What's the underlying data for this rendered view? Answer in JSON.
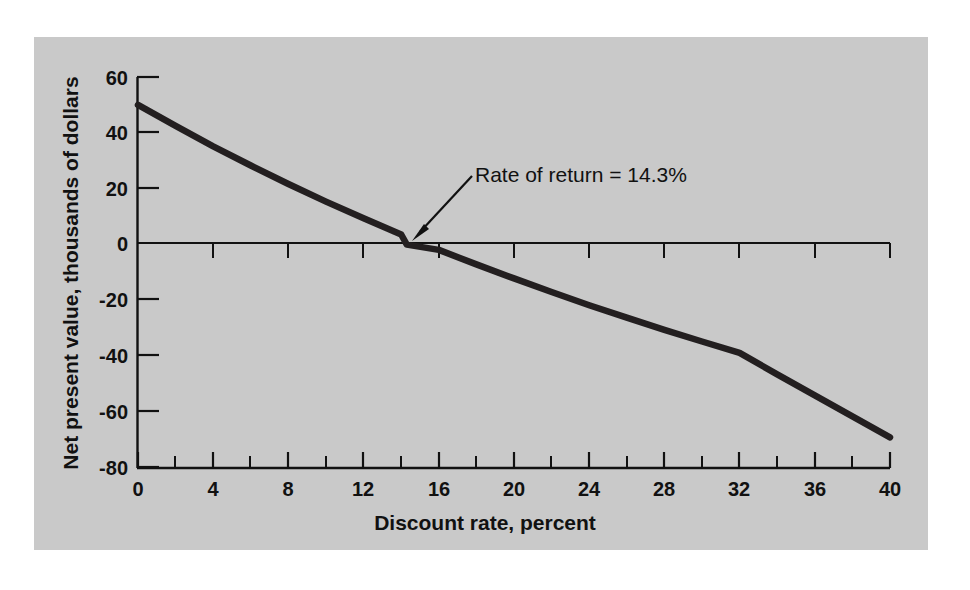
{
  "chart_data": {
    "type": "line",
    "title": "",
    "subtitle": "",
    "xlabel": "Discount rate, percent",
    "ylabel": "Net present value, thousands of dollars",
    "xlim": [
      0,
      40
    ],
    "ylim": [
      -80,
      60
    ],
    "grid": false,
    "legend": null,
    "x_tick_labels": [
      "0",
      "4",
      "8",
      "12",
      "16",
      "20",
      "24",
      "28",
      "32",
      "36",
      "40"
    ],
    "x_tick_values": [
      0,
      4,
      8,
      12,
      16,
      20,
      24,
      28,
      32,
      36,
      40
    ],
    "x_minor_tick_values": [
      2,
      6,
      10,
      14,
      18,
      22,
      26,
      30,
      34,
      38
    ],
    "y_tick_labels": [
      "60",
      "40",
      "20",
      "0",
      "-20",
      "-40",
      "-60",
      "-80"
    ],
    "y_tick_values": [
      60,
      40,
      20,
      0,
      -20,
      -40,
      -60,
      -80
    ],
    "zero_line": 0,
    "series": [
      {
        "name": "Net present value",
        "color": "#231f20",
        "x": [
          0,
          2,
          4,
          6,
          8,
          10,
          12,
          14,
          14.3,
          16,
          18,
          20,
          22,
          24,
          26,
          28,
          30,
          32,
          34,
          36,
          38,
          40
        ],
        "values": [
          50.0,
          42.5,
          35.2,
          28.3,
          21.7,
          15.4,
          9.4,
          3.6,
          0.0,
          -1.9,
          -7.1,
          -12.1,
          -17.0,
          -21.7,
          -26.2,
          -30.5,
          -34.7,
          -38.8,
          -46.5,
          -54.0,
          -61.5,
          -69.0
        ]
      }
    ],
    "annotations": [
      {
        "text": "Rate of return = 14.3%",
        "x": 14.3,
        "y": 0,
        "arrow": true
      }
    ]
  },
  "figure": {
    "background_color": "#ffffff",
    "panel_color": "#c9c9c9",
    "axis_color": "#111111",
    "curve_color": "#231f20"
  }
}
